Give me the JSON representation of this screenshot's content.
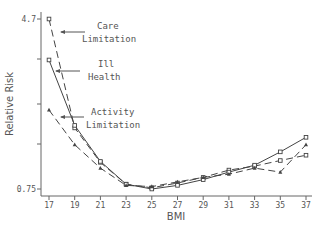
{
  "chart_data": {
    "type": "line",
    "title": "",
    "xlabel": "BMI",
    "ylabel": "Relative Risk",
    "yscale": "log",
    "ylim": [
      0.75,
      4.7
    ],
    "y_tick_labels": [
      "4.7",
      "0.75"
    ],
    "x": [
      17,
      19,
      21,
      23,
      25,
      27,
      29,
      31,
      33,
      35,
      37
    ],
    "x_tick_labels": [
      "17",
      "19",
      "21",
      "23",
      "25",
      "27",
      "29",
      "31",
      "33",
      "35",
      "37"
    ],
    "grid": false,
    "legend": "inline annotations with arrows",
    "series": [
      {
        "name": "Care Limitation",
        "line": "dashed",
        "marker": "square",
        "values": [
          4.7,
          1.45,
          1.0,
          0.79,
          0.76,
          0.8,
          0.85,
          0.92,
          0.96,
          1.02,
          1.08
        ]
      },
      {
        "name": "Ill Health",
        "line": "solid",
        "marker": "square",
        "values": [
          3.02,
          1.49,
          1.01,
          0.79,
          0.75,
          0.78,
          0.83,
          0.9,
          0.97,
          1.12,
          1.31
        ]
      },
      {
        "name": "Activity Limitation",
        "line": "dashed",
        "marker": "triangle",
        "values": [
          1.76,
          1.21,
          0.94,
          0.78,
          0.77,
          0.81,
          0.85,
          0.88,
          0.94,
          0.9,
          1.21
        ]
      }
    ],
    "annotations": [
      {
        "text": [
          "Care",
          "Limitation"
        ],
        "points_to": "Care Limitation"
      },
      {
        "text": [
          "Ill",
          "Health"
        ],
        "points_to": "Ill Health"
      },
      {
        "text": [
          "Activity",
          "Limitation"
        ],
        "points_to": "Activity Limitation"
      }
    ]
  },
  "labels": {
    "ylabel": "Relative Risk",
    "xlabel": "BMI",
    "ytop": "4.7",
    "ybottom": "0.75",
    "care1": "Care",
    "care2": "Limitation",
    "ill1": "Ill",
    "ill2": "Health",
    "act1": "Activity",
    "act2": "Limitation"
  }
}
